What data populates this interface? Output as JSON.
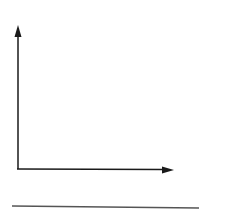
{
  "diagram": {
    "type": "empty-axes",
    "stroke_color": "#1a1a1a",
    "baseline_color": "#555555",
    "y_axis": {
      "x": 18,
      "y_start": 169,
      "y_end": 27,
      "arrow": "up"
    },
    "x_axis": {
      "y": 169,
      "x_start": 17,
      "x_end": 173,
      "arrow": "right"
    },
    "baseline": {
      "y": 207,
      "x_start": 12,
      "x_end": 199
    }
  }
}
